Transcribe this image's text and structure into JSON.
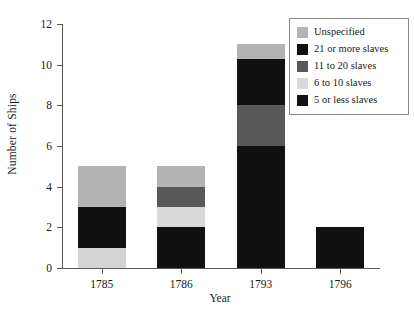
{
  "chart_data": {
    "type": "bar",
    "subtype": "stacked",
    "title": "",
    "xlabel": "Year",
    "ylabel": "Number of Ships",
    "categories": [
      "1785",
      "1786",
      "1793",
      "1796"
    ],
    "ylim": [
      0,
      12
    ],
    "yticks": [
      0,
      2,
      4,
      6,
      8,
      10,
      12
    ],
    "grid": false,
    "legend_position": "top-right",
    "series": [
      {
        "name": "Unspecified",
        "color": "#b3b3b3",
        "values": [
          2,
          1,
          1,
          0
        ]
      },
      {
        "name": "21 or more slaves",
        "color": "#111111",
        "values": [
          2,
          0,
          2,
          2
        ]
      },
      {
        "name": "11 to 20 slaves",
        "color": "#585858",
        "values": [
          0,
          1,
          2,
          0
        ]
      },
      {
        "name": "6 to 10 slaves",
        "color": "#d9d9d9",
        "values": [
          0,
          1,
          0,
          0
        ]
      },
      {
        "name": "5 or less slaves",
        "color": "#111111",
        "values": [
          1,
          2,
          6,
          0
        ]
      }
    ],
    "stack_order_bottom_to_top": [
      "5 or less slaves",
      "6 to 10 slaves",
      "11 to 20 slaves",
      "21 or more slaves",
      "Unspecified"
    ],
    "totals": [
      5,
      5,
      11,
      2
    ],
    "bars": [
      {
        "category": "1785",
        "segments": [
          {
            "series": "5 or less slaves",
            "value": 1,
            "from": 0,
            "to": 1,
            "color": "#d4d4d4"
          },
          {
            "series": "21 or more slaves",
            "value": 2,
            "from": 1,
            "to": 3,
            "color": "#111111"
          },
          {
            "series": "Unspecified",
            "value": 2,
            "from": 3,
            "to": 5,
            "color": "#b3b3b3"
          }
        ]
      },
      {
        "category": "1786",
        "segments": [
          {
            "series": "5 or less slaves",
            "value": 2,
            "from": 0,
            "to": 2,
            "color": "#111111"
          },
          {
            "series": "6 to 10 slaves",
            "value": 1,
            "from": 2,
            "to": 3,
            "color": "#d9d9d9"
          },
          {
            "series": "11 to 20 slaves",
            "value": 1,
            "from": 3,
            "to": 4,
            "color": "#585858"
          },
          {
            "series": "Unspecified",
            "value": 1,
            "from": 4,
            "to": 5,
            "color": "#b3b3b3"
          }
        ]
      },
      {
        "category": "1793",
        "segments": [
          {
            "series": "5 or less slaves",
            "value": 6,
            "from": 0,
            "to": 6,
            "color": "#111111"
          },
          {
            "series": "11 to 20 slaves",
            "value": 2,
            "from": 6,
            "to": 8,
            "color": "#585858"
          },
          {
            "series": "21 or more slaves",
            "value": 2.3,
            "from": 8,
            "to": 10.3,
            "color": "#111111"
          },
          {
            "series": "Unspecified",
            "value": 0.7,
            "from": 10.3,
            "to": 11,
            "color": "#b3b3b3"
          }
        ]
      },
      {
        "category": "1796",
        "segments": [
          {
            "series": "21 or more slaves",
            "value": 2,
            "from": 0,
            "to": 2,
            "color": "#111111"
          }
        ]
      }
    ]
  },
  "legend": {
    "items": [
      {
        "label": "Unspecified",
        "color": "#b3b3b3"
      },
      {
        "label": "21 or more slaves",
        "color": "#111111"
      },
      {
        "label": "11 to 20 slaves",
        "color": "#585858"
      },
      {
        "label": "6 to 10 slaves",
        "color": "#d9d9d9"
      },
      {
        "label": "5 or less slaves",
        "color": "#111111"
      }
    ]
  },
  "axes": {
    "y_title": "Number of Ships",
    "x_title": "Year",
    "y_tick_labels": [
      "0",
      "2",
      "4",
      "6",
      "8",
      "10",
      "12"
    ],
    "x_tick_labels": [
      "1785",
      "1786",
      "1793",
      "1796"
    ]
  }
}
